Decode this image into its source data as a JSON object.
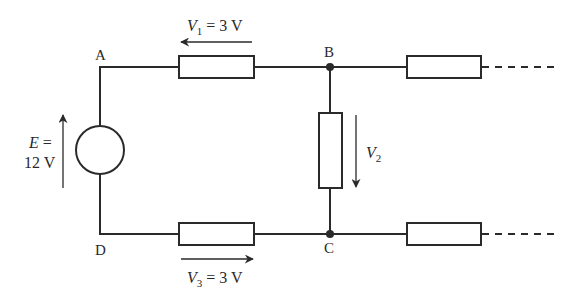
{
  "nodes": {
    "A": "A",
    "B": "B",
    "C": "C",
    "D": "D"
  },
  "source": {
    "symbol": "E",
    "eq": " =",
    "value": "12 V"
  },
  "voltages": {
    "v1": {
      "symbol": "V",
      "sub": "1",
      "eq": " = 3 V"
    },
    "v2": {
      "symbol": "V",
      "sub": "2"
    },
    "v3": {
      "symbol": "V",
      "sub": "3",
      "eq": " = 3 V"
    }
  },
  "colors": {
    "ink": "#2a2a2a",
    "background": "#ffffff"
  }
}
